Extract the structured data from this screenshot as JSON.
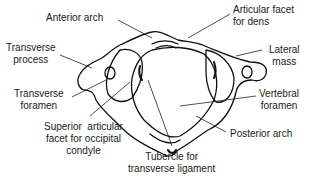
{
  "diagram": {
    "labels": {
      "anterior_arch": "Anterior arch",
      "articular_facet_dens": "Articular facet\nfor dens",
      "transverse_process": "Transverse\nprocess",
      "lateral_mass": "Lateral\nmass",
      "transverse_foramen": "Transverse\nforamen",
      "vertebral_foramen": "Vertebral\nforamen",
      "superior_articular_facet": "Superior  articular\nfacet for occipital\ncondyle",
      "posterior_arch": "Posterior arch",
      "tubercle": "Tubercle for\ntransverse ligament"
    }
  }
}
